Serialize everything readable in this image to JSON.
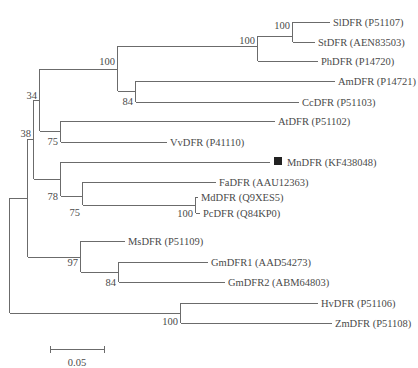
{
  "figure": {
    "type": "phylogenetic-tree",
    "colors": {
      "branch": "#6b6b6b",
      "text": "#4a4a4a",
      "marker": "#222222"
    },
    "scale_bar": {
      "label": "0.05",
      "x1": 50,
      "x2": 105,
      "y": 325
    },
    "taxa": [
      {
        "id": "sl",
        "label": "SlDFR (P51107)",
        "y": 22,
        "x_end": 330
      },
      {
        "id": "st",
        "label": "StDFR (AEN83503)",
        "y": 42,
        "x_end": 315
      },
      {
        "id": "ph",
        "label": "PhDFR (P14720)",
        "y": 61,
        "x_end": 318
      },
      {
        "id": "am",
        "label": "AmDFR (P14721)",
        "y": 81,
        "x_end": 335
      },
      {
        "id": "cc",
        "label": "CcDFR (P51103)",
        "y": 102,
        "x_end": 299
      },
      {
        "id": "at",
        "label": "AtDFR (P51102)",
        "y": 121,
        "x_end": 275
      },
      {
        "id": "vv",
        "label": "VvDFR (P41110)",
        "y": 142,
        "x_end": 167
      },
      {
        "id": "mn",
        "label": "MnDFR (KF438048)",
        "y": 162,
        "x_end": 270,
        "marker": "filled-square"
      },
      {
        "id": "fa",
        "label": "FaDFR (AAU12363)",
        "y": 182,
        "x_end": 216
      },
      {
        "id": "md",
        "label": "MdDFR (Q9XES5)",
        "y": 197,
        "x_end": 198
      },
      {
        "id": "pc",
        "label": "PcDFR (Q84KP0)",
        "y": 213,
        "x_end": 200
      },
      {
        "id": "ms",
        "label": "MsDFR (P51109)",
        "y": 241,
        "x_end": 125
      },
      {
        "id": "gm1",
        "label": "GmDFR1 (AAD54273)",
        "y": 262,
        "x_end": 208
      },
      {
        "id": "gm2",
        "label": "GmDFR2 (ABM64803)",
        "y": 282,
        "x_end": 225
      },
      {
        "id": "hv",
        "label": "HvDFR (P51106)",
        "y": 303,
        "x_end": 318
      },
      {
        "id": "zm",
        "label": "ZmDFR (P51108)",
        "y": 323,
        "x_end": 332
      }
    ],
    "bootstrap": [
      {
        "node": "sl-st",
        "value": "100",
        "x": 290,
        "y": 28
      },
      {
        "node": "sl-st-ph",
        "value": "100",
        "x": 255,
        "y": 44
      },
      {
        "node": "solanaceae-am-cc",
        "value": "100",
        "x": 115,
        "y": 64
      },
      {
        "node": "am-cc",
        "value": "84",
        "x": 133,
        "y": 104
      },
      {
        "node": "group-34",
        "value": "34",
        "x": 37,
        "y": 98
      },
      {
        "node": "at-vv",
        "value": "75",
        "x": 59,
        "y": 145
      },
      {
        "node": "group-38",
        "value": "38",
        "x": 31,
        "y": 136
      },
      {
        "node": "mn-rosaceae",
        "value": "78",
        "x": 58,
        "y": 200
      },
      {
        "node": "fa-md-pc",
        "value": "75",
        "x": 80,
        "y": 214
      },
      {
        "node": "md-pc",
        "value": "100",
        "x": 193,
        "y": 217
      },
      {
        "node": "ms-gm",
        "value": "97",
        "x": 78,
        "y": 264
      },
      {
        "node": "gm1-gm2",
        "value": "84",
        "x": 116,
        "y": 284
      },
      {
        "node": "hv-zm",
        "value": "100",
        "x": 178,
        "y": 323
      }
    ]
  }
}
